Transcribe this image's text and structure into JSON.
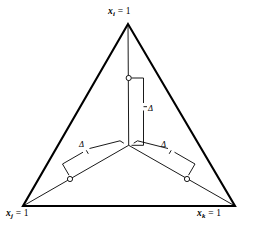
{
  "figure": {
    "type": "ternary-simplex-diagram",
    "background_color": "#ffffff",
    "ink_color": "#000000",
    "vertex_labels": {
      "top": {
        "var": "x",
        "sub": "i",
        "eq": " = 1",
        "full": "x_i = 1"
      },
      "bottom_left": {
        "var": "x",
        "sub": "j",
        "eq": " = 1",
        "full": "x_j = 1"
      },
      "bottom_right": {
        "var": "x",
        "sub": "k",
        "eq": " = 1",
        "full": "x_k = 1"
      }
    },
    "annotations": {
      "delta_top": "Δ",
      "delta_left": "Δ",
      "delta_right": "Δ"
    },
    "geometry": {
      "triangle_vertices": [
        [
          128,
          24
        ],
        [
          23,
          206
        ],
        [
          235,
          206
        ]
      ],
      "centroid": [
        128.7,
        145.3
      ],
      "markers": [
        [
          128.7,
          78
        ],
        [
          70,
          179
        ],
        [
          187,
          179
        ]
      ],
      "outer_stroke_width": 2.1,
      "median_stroke_width": 0.9,
      "bracket_stroke_width": 0.9,
      "marker_radius": 2.6
    }
  }
}
